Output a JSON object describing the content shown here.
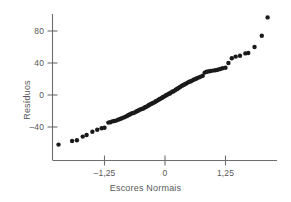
{
  "chart_data": {
    "type": "scatter",
    "title": "",
    "subtitle": "",
    "xlabel": "Escores Normais",
    "ylabel": "Resíduos",
    "xticks": [
      "-1,25",
      "0",
      "1,25"
    ],
    "xtick_values": [
      -1.25,
      0,
      1.25
    ],
    "yticks": [
      "80",
      "40",
      "0",
      "-40"
    ],
    "ytick_values": [
      80,
      40,
      0,
      -40
    ],
    "xlim": [
      -2.55,
      2.35
    ],
    "ylim": [
      -72,
      108
    ],
    "grid": false,
    "legend": null,
    "marker_color": "#1a1a1a",
    "axis_color": "#6e6e70",
    "text_color": "#58585a",
    "points": [
      [
        -2.2,
        -62.0
      ],
      [
        -1.92,
        -57.5
      ],
      [
        -1.82,
        -56.5
      ],
      [
        -1.7,
        -52.0
      ],
      [
        -1.62,
        -50.0
      ],
      [
        -1.5,
        -46.0
      ],
      [
        -1.4,
        -43.5
      ],
      [
        -1.31,
        -41.5
      ],
      [
        -1.25,
        -41.0
      ],
      [
        -1.17,
        -34.5
      ],
      [
        -1.13,
        -34.0
      ],
      [
        -1.09,
        -33.0
      ],
      [
        -1.05,
        -32.5
      ],
      [
        -1.01,
        -32.0
      ],
      [
        -0.97,
        -31.0
      ],
      [
        -0.93,
        -30.0
      ],
      [
        -0.89,
        -29.0
      ],
      [
        -0.85,
        -28.0
      ],
      [
        -0.81,
        -27.0
      ],
      [
        -0.78,
        -26.0
      ],
      [
        -0.75,
        -25.0
      ],
      [
        -0.72,
        -24.0
      ],
      [
        -0.69,
        -23.0
      ],
      [
        -0.66,
        -22.5
      ],
      [
        -0.63,
        -22.0
      ],
      [
        -0.6,
        -21.0
      ],
      [
        -0.57,
        -20.0
      ],
      [
        -0.54,
        -19.0
      ],
      [
        -0.51,
        -18.0
      ],
      [
        -0.48,
        -17.5
      ],
      [
        -0.45,
        -17.0
      ],
      [
        -0.43,
        -16.0
      ],
      [
        -0.4,
        -15.0
      ],
      [
        -0.38,
        -14.5
      ],
      [
        -0.35,
        -13.5
      ],
      [
        -0.33,
        -12.5
      ],
      [
        -0.3,
        -11.5
      ],
      [
        -0.28,
        -11.0
      ],
      [
        -0.25,
        -10.0
      ],
      [
        -0.23,
        -9.5
      ],
      [
        -0.2,
        -8.5
      ],
      [
        -0.18,
        -7.5
      ],
      [
        -0.16,
        -7.0
      ],
      [
        -0.13,
        -6.0
      ],
      [
        -0.11,
        -5.0
      ],
      [
        -0.09,
        -4.5
      ],
      [
        -0.06,
        -3.5
      ],
      [
        -0.04,
        -2.5
      ],
      [
        -0.02,
        -2.0
      ],
      [
        0.01,
        -1.0
      ],
      [
        0.03,
        0.0
      ],
      [
        0.05,
        0.5
      ],
      [
        0.08,
        1.5
      ],
      [
        0.1,
        2.0
      ],
      [
        0.12,
        3.0
      ],
      [
        0.15,
        4.0
      ],
      [
        0.17,
        4.5
      ],
      [
        0.2,
        5.5
      ],
      [
        0.22,
        6.5
      ],
      [
        0.25,
        7.5
      ],
      [
        0.27,
        8.5
      ],
      [
        0.3,
        9.5
      ],
      [
        0.32,
        10.5
      ],
      [
        0.35,
        11.5
      ],
      [
        0.38,
        12.5
      ],
      [
        0.41,
        13.5
      ],
      [
        0.44,
        14.5
      ],
      [
        0.47,
        15.5
      ],
      [
        0.5,
        16.5
      ],
      [
        0.53,
        17.0
      ],
      [
        0.56,
        18.0
      ],
      [
        0.59,
        19.0
      ],
      [
        0.63,
        20.0
      ],
      [
        0.66,
        21.0
      ],
      [
        0.7,
        22.0
      ],
      [
        0.74,
        23.0
      ],
      [
        0.78,
        24.0
      ],
      [
        0.82,
        28.0
      ],
      [
        0.86,
        29.0
      ],
      [
        0.9,
        29.5
      ],
      [
        0.94,
        30.0
      ],
      [
        0.99,
        30.5
      ],
      [
        1.04,
        31.0
      ],
      [
        1.09,
        31.5
      ],
      [
        1.14,
        32.5
      ],
      [
        1.19,
        33.5
      ],
      [
        1.25,
        34.0
      ],
      [
        1.31,
        40.0
      ],
      [
        1.38,
        46.0
      ],
      [
        1.46,
        48.0
      ],
      [
        1.55,
        49.0
      ],
      [
        1.66,
        52.0
      ],
      [
        1.72,
        52.5
      ],
      [
        1.85,
        60.0
      ],
      [
        2.0,
        74.0
      ],
      [
        2.12,
        97.0
      ]
    ]
  },
  "axes": {
    "x_axis_line": "horizontal-axis",
    "y_axis_line": "vertical-axis"
  }
}
